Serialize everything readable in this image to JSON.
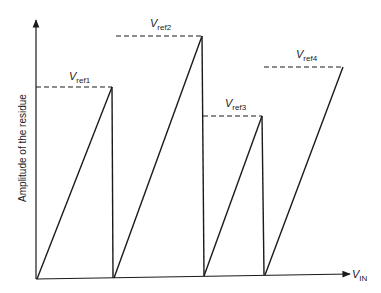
{
  "diagram": {
    "type": "residue-sawtooth",
    "y_axis_label": "Amplitude of the residue",
    "x_axis_label": {
      "main": "V",
      "sub": "IN"
    },
    "segments": [
      {
        "name": "ramp-1",
        "ref_label": {
          "main": "V",
          "sub": "ref1"
        },
        "relative_peak": 0.77
      },
      {
        "name": "ramp-2",
        "ref_label": {
          "main": "V",
          "sub": "ref2"
        },
        "relative_peak": 1.0
      },
      {
        "name": "ramp-3",
        "ref_label": {
          "main": "V",
          "sub": "ref3"
        },
        "relative_peak": 0.66
      },
      {
        "name": "ramp-4",
        "ref_label": {
          "main": "V",
          "sub": "ref4"
        },
        "relative_peak": 0.87
      }
    ]
  }
}
